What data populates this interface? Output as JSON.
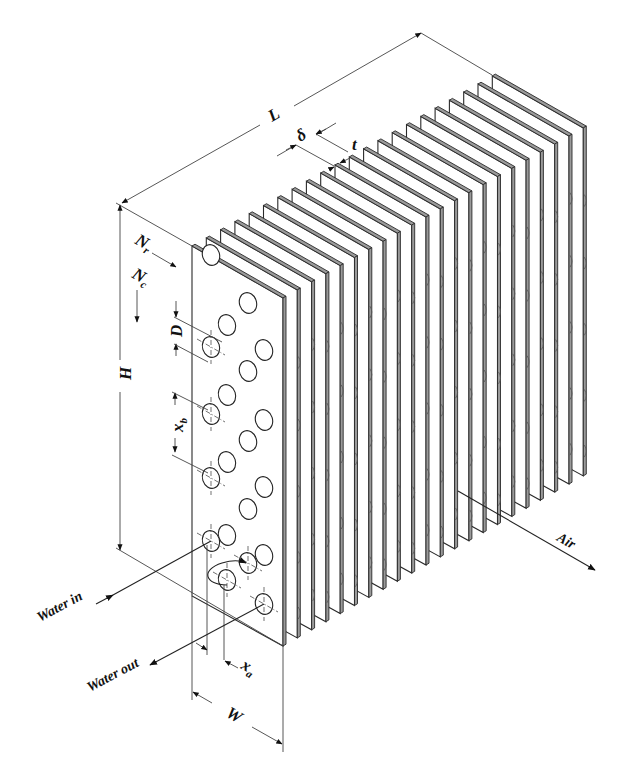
{
  "figure": {
    "background": "#ffffff",
    "ink": "#222222"
  },
  "labels": {
    "L": "L",
    "H": "H",
    "W": "W",
    "delta": "δ",
    "t": "t",
    "Nr": "N",
    "Nr_sub": "r",
    "Nc": "N",
    "Nc_sub": "c",
    "D": "D",
    "xb": "x",
    "xb_sub": "b",
    "xa": "x",
    "xa_sub": "a",
    "water_in": "Water in",
    "water_out": "Water out",
    "air": "Air"
  },
  "geometry": {
    "fin_count": 22,
    "front_plate": {
      "top_left": [
        192,
        246
      ],
      "top_right": [
        283,
        298
      ],
      "bottom_right": [
        283,
        646
      ],
      "bottom_left": [
        192,
        596
      ]
    },
    "fin_step": [
      14.3,
      -8.1
    ],
    "fin_thickness_px": 3,
    "tube_holes": [
      [
        211,
        255
      ],
      [
        248,
        303
      ],
      [
        227,
        325
      ],
      [
        264,
        350
      ],
      [
        211,
        347
      ],
      [
        248,
        371
      ],
      [
        227,
        395
      ],
      [
        264,
        420
      ],
      [
        211,
        414
      ],
      [
        248,
        441
      ],
      [
        227,
        462
      ],
      [
        264,
        487
      ],
      [
        211,
        478
      ],
      [
        248,
        509
      ],
      [
        227,
        535
      ],
      [
        264,
        555
      ],
      [
        211,
        541
      ],
      [
        248,
        563
      ],
      [
        227,
        580
      ],
      [
        264,
        604
      ]
    ],
    "marked_holes": [
      [
        211,
        347
      ],
      [
        211,
        414
      ],
      [
        211,
        478
      ],
      [
        211,
        541
      ],
      [
        248,
        563
      ],
      [
        227,
        580
      ],
      [
        264,
        604
      ]
    ]
  },
  "dimensions": {
    "H": {
      "x": 120,
      "y1": 205,
      "y2": 550
    },
    "L": {
      "from": [
        122,
        203
      ],
      "to": [
        421,
        33
      ]
    },
    "W": {
      "from": [
        192,
        693
      ],
      "to": [
        283,
        744
      ]
    }
  }
}
